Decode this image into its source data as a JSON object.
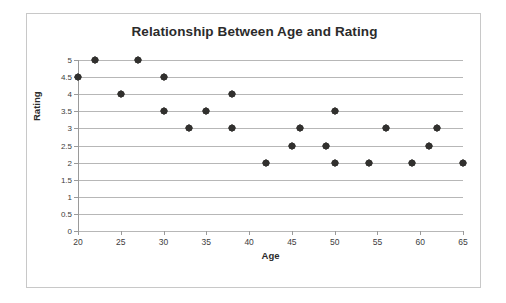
{
  "chart_data": {
    "type": "scatter",
    "title": "Relationship Between Age and Rating",
    "xlabel": "Age",
    "ylabel": "Rating",
    "xlim": [
      20,
      65
    ],
    "ylim": [
      0,
      5
    ],
    "xticks": [
      20,
      25,
      30,
      35,
      40,
      45,
      50,
      55,
      60,
      65
    ],
    "yticks": [
      0,
      0.5,
      1,
      1.5,
      2,
      2.5,
      3,
      3.5,
      4,
      4.5,
      5
    ],
    "xtick_labels": [
      "20",
      "25",
      "30",
      "35",
      "40",
      "45",
      "50",
      "55",
      "60",
      "65"
    ],
    "ytick_labels": [
      "0",
      "0.5",
      "1",
      "1.5",
      "2",
      "2.5",
      "3",
      "3.5",
      "4",
      "4.5",
      "5"
    ],
    "grid": "horizontal",
    "legend": null,
    "marker": "diamond",
    "marker_color": "#31302e",
    "gridline_color": "#b7b7b7",
    "axis_color": "#9a9a9a",
    "series": [
      {
        "name": "Age vs Rating",
        "points": [
          {
            "x": 20,
            "y": 4.5
          },
          {
            "x": 22,
            "y": 5
          },
          {
            "x": 25,
            "y": 4
          },
          {
            "x": 27,
            "y": 5
          },
          {
            "x": 30,
            "y": 4.5
          },
          {
            "x": 30,
            "y": 3.5
          },
          {
            "x": 33,
            "y": 3
          },
          {
            "x": 35,
            "y": 3.5
          },
          {
            "x": 38,
            "y": 4
          },
          {
            "x": 38,
            "y": 3
          },
          {
            "x": 42,
            "y": 2
          },
          {
            "x": 45,
            "y": 2.5
          },
          {
            "x": 46,
            "y": 3
          },
          {
            "x": 49,
            "y": 2.5
          },
          {
            "x": 50,
            "y": 3.5
          },
          {
            "x": 50,
            "y": 2
          },
          {
            "x": 54,
            "y": 2
          },
          {
            "x": 56,
            "y": 3
          },
          {
            "x": 59,
            "y": 2
          },
          {
            "x": 61,
            "y": 2.5
          },
          {
            "x": 62,
            "y": 3
          },
          {
            "x": 65,
            "y": 2
          }
        ]
      }
    ]
  }
}
